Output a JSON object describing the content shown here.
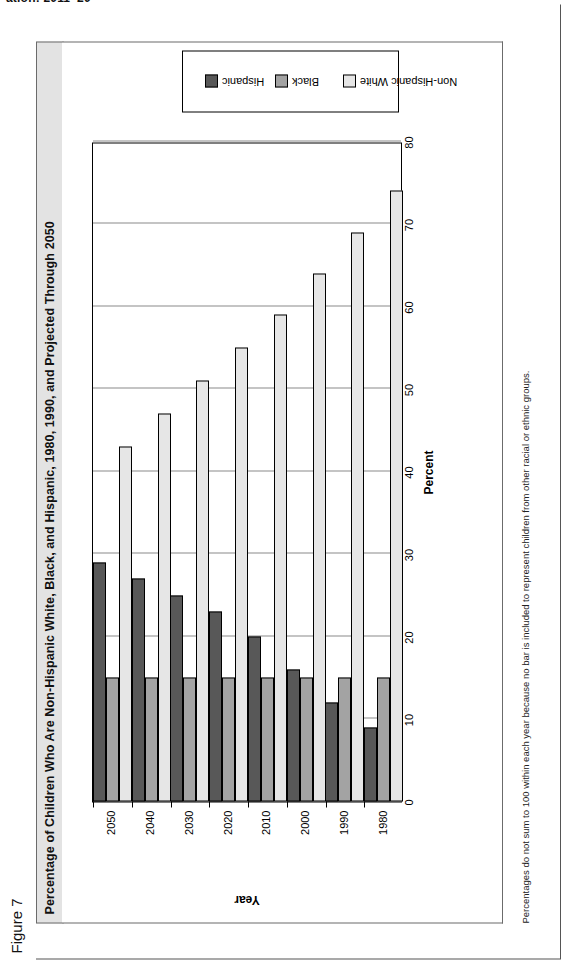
{
  "clipped_header": "ation: 2011–20",
  "figure_label": "Figure 7",
  "title": "Percentage of Children Who Are Non-Hispanic White, Black, and Hispanic, 1980, 1990, and Projected Through 2050",
  "footnote": "Percentages do not sum to 100 within each year because no bar is included to represent children from other racial or ethnic groups.",
  "legend": {
    "items": [
      {
        "label": "Non-Hispanic White",
        "color": "#e6e6e6"
      },
      {
        "label": "Black",
        "color": "#a3a3a3"
      },
      {
        "label": "Hispanic",
        "color": "#585858"
      }
    ]
  },
  "chart_data": {
    "type": "bar",
    "orientation": "horizontal",
    "title": "Percentage of Children Who Are Non-Hispanic White, Black, and Hispanic, 1980, 1990, and Projected Through 2050",
    "xlabel": "Percent",
    "ylabel": "Year",
    "categories": [
      "1980",
      "1990",
      "2000",
      "2010",
      "2020",
      "2030",
      "2040",
      "2050"
    ],
    "xlim": [
      0,
      80
    ],
    "xticks": [
      0,
      10,
      20,
      30,
      40,
      50,
      60,
      70,
      80
    ],
    "grid": true,
    "legend_position": "right",
    "series": [
      {
        "name": "Non-Hispanic White",
        "color": "#e6e6e6",
        "values": [
          74,
          69,
          64,
          59,
          55,
          51,
          47,
          43
        ]
      },
      {
        "name": "Black",
        "color": "#a3a3a3",
        "values": [
          15,
          15,
          15,
          15,
          15,
          15,
          15,
          15
        ]
      },
      {
        "name": "Hispanic",
        "color": "#585858",
        "values": [
          9,
          12,
          16,
          20,
          23,
          25,
          27,
          29
        ]
      }
    ]
  }
}
